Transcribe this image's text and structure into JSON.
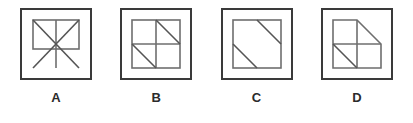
{
  "question_type": "multiple-choice-figure-options",
  "options": [
    {
      "label": "A",
      "figure_name": "rectangle-with-crossed-diagonals-and-vertical-line"
    },
    {
      "label": "B",
      "figure_name": "square-quadrants-with-two-opposite-diagonals"
    },
    {
      "label": "C",
      "figure_name": "square-with-two-parallel-offset-diagonals"
    },
    {
      "label": "D",
      "figure_name": "square-quadrants-with-cut-top-right-corner"
    }
  ],
  "colors": {
    "background": "#ffffff",
    "frame_border": "#3a3a3a",
    "inner_line": "#6e6e6e",
    "diagonal_line": "#555555",
    "label_text": "#2b2b2b"
  }
}
